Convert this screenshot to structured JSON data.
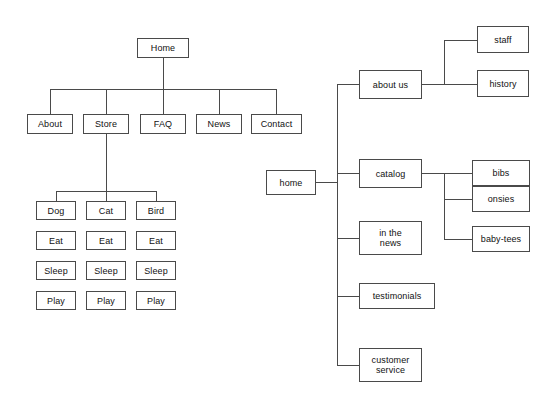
{
  "diagram": {
    "left_tree": {
      "root": {
        "label": "Home"
      },
      "level1": [
        {
          "label": "About"
        },
        {
          "label": "Store"
        },
        {
          "label": "FAQ"
        },
        {
          "label": "News"
        },
        {
          "label": "Contact"
        }
      ],
      "store_children": [
        {
          "label": "Dog"
        },
        {
          "label": "Cat"
        },
        {
          "label": "Bird"
        }
      ],
      "leaf_columns": [
        {
          "parent": "Dog",
          "items": [
            "Eat",
            "Sleep",
            "Play"
          ]
        },
        {
          "parent": "Cat",
          "items": [
            "Eat",
            "Sleep",
            "Play"
          ]
        },
        {
          "parent": "Bird",
          "items": [
            "Eat",
            "Sleep",
            "Play"
          ]
        }
      ]
    },
    "right_tree": {
      "root": {
        "label": "home"
      },
      "level1": [
        {
          "label": "about us"
        },
        {
          "label": "catalog"
        },
        {
          "label": "in the\nnews"
        },
        {
          "label": "testimonials"
        },
        {
          "label": "customer\nservice"
        }
      ],
      "about_us_children": [
        {
          "label": "staff"
        },
        {
          "label": "history"
        }
      ],
      "catalog_children": [
        {
          "label": "bibs"
        },
        {
          "label": "onsies"
        },
        {
          "label": "baby-tees"
        }
      ]
    },
    "colors": {
      "stroke": "#4a4a4a",
      "node_fill": "#ffffff",
      "text": "#111111",
      "background": "#ffffff"
    }
  }
}
